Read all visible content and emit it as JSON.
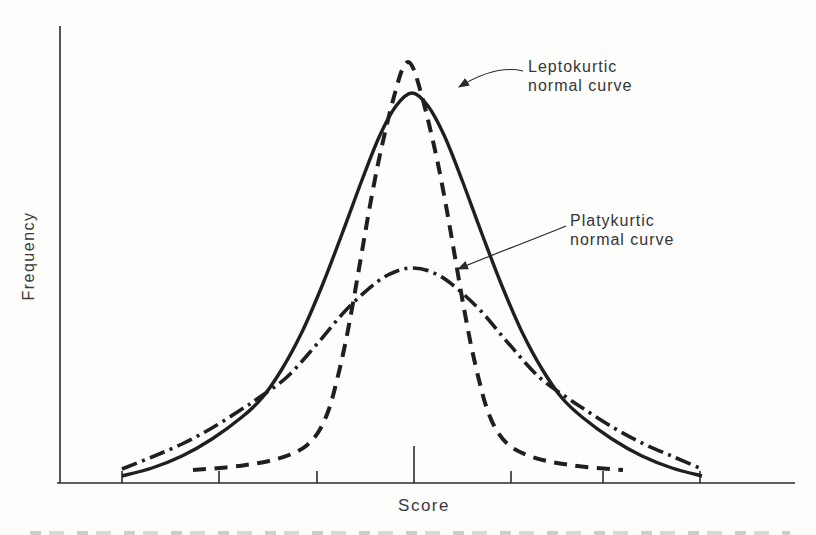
{
  "figure": {
    "background": "#fdfdfb",
    "ink_color": "#1f1f1f"
  },
  "axes": {
    "xlabel": "Score",
    "ylabel": "Frequency"
  },
  "annotations": {
    "leptokurtic": {
      "line1": "Leptokurtic",
      "line2": "normal curve",
      "target_curve": "leptokurtic"
    },
    "platykurtic": {
      "line1": "Platykurtic",
      "line2": "normal curve",
      "target_curve": "platykurtic"
    }
  },
  "chart_data": {
    "type": "line",
    "title": "",
    "xlabel": "Score",
    "ylabel": "Frequency",
    "axis_notes": "Qualitative figure: no numeric tick labels; seven unlabeled ticks on score axis, taller tick at center (mean); curve points given in image pixel coordinates",
    "x_axis": {
      "tick_positions_px": [
        122,
        219,
        317,
        414,
        511,
        603,
        700
      ],
      "center_tick_index": 3,
      "numeric_labels": false,
      "axis_y_px": 483,
      "axis_span_px": [
        57,
        795
      ]
    },
    "y_axis": {
      "line_x_px": 60,
      "span_px": [
        26,
        483
      ],
      "numeric_labels": false
    },
    "curves": [
      {
        "name": "normal-curve",
        "label": "Normal (mesokurtic) curve",
        "style": "solid",
        "points": [
          [
            122,
            476
          ],
          [
            152,
            468
          ],
          [
            182,
            456
          ],
          [
            212,
            439
          ],
          [
            242,
            417
          ],
          [
            262,
            398
          ],
          [
            282,
            369
          ],
          [
            302,
            332
          ],
          [
            322,
            286
          ],
          [
            342,
            234
          ],
          [
            362,
            180
          ],
          [
            380,
            135
          ],
          [
            396,
            106
          ],
          [
            412,
            93
          ],
          [
            428,
            106
          ],
          [
            444,
            135
          ],
          [
            462,
            180
          ],
          [
            482,
            234
          ],
          [
            502,
            286
          ],
          [
            522,
            332
          ],
          [
            542,
            369
          ],
          [
            562,
            398
          ],
          [
            582,
            417
          ],
          [
            612,
            439
          ],
          [
            642,
            456
          ],
          [
            672,
            468
          ],
          [
            702,
            476
          ]
        ]
      },
      {
        "name": "leptokurtic",
        "label": "Leptokurtic normal curve",
        "style": "dashed",
        "points": [
          [
            193,
            470
          ],
          [
            220,
            468
          ],
          [
            246,
            465
          ],
          [
            269,
            461
          ],
          [
            289,
            455
          ],
          [
            306,
            446
          ],
          [
            319,
            431
          ],
          [
            329,
            409
          ],
          [
            337,
            380
          ],
          [
            345,
            345
          ],
          [
            353,
            303
          ],
          [
            361,
            257
          ],
          [
            369,
            211
          ],
          [
            378,
            164
          ],
          [
            387,
            124
          ],
          [
            395,
            93
          ],
          [
            402,
            70
          ],
          [
            408,
            62
          ],
          [
            414,
            70
          ],
          [
            421,
            93
          ],
          [
            429,
            124
          ],
          [
            438,
            164
          ],
          [
            447,
            211
          ],
          [
            455,
            257
          ],
          [
            463,
            303
          ],
          [
            471,
            345
          ],
          [
            479,
            380
          ],
          [
            487,
            409
          ],
          [
            497,
            431
          ],
          [
            510,
            446
          ],
          [
            527,
            455
          ],
          [
            547,
            461
          ],
          [
            570,
            465
          ],
          [
            596,
            468
          ],
          [
            623,
            470
          ]
        ]
      },
      {
        "name": "platykurtic",
        "label": "Platykurtic normal curve",
        "style": "dashdot",
        "points": [
          [
            122,
            469
          ],
          [
            152,
            457
          ],
          [
            182,
            444
          ],
          [
            212,
            428
          ],
          [
            242,
            409
          ],
          [
            257,
            399
          ],
          [
            287,
            377
          ],
          [
            317,
            344
          ],
          [
            347,
            309
          ],
          [
            377,
            282
          ],
          [
            397,
            271
          ],
          [
            413,
            268
          ],
          [
            429,
            271
          ],
          [
            449,
            282
          ],
          [
            479,
            309
          ],
          [
            509,
            344
          ],
          [
            539,
            377
          ],
          [
            569,
            399
          ],
          [
            584,
            409
          ],
          [
            614,
            428
          ],
          [
            644,
            444
          ],
          [
            674,
            457
          ],
          [
            702,
            469
          ]
        ]
      }
    ]
  }
}
